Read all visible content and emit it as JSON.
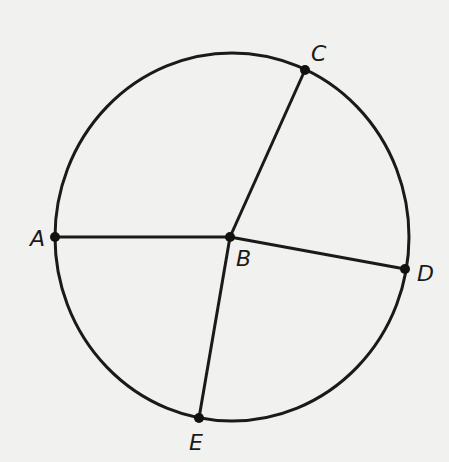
{
  "diagram": {
    "type": "circle-with-radii",
    "circle": {
      "cx": 232,
      "cy": 237,
      "rx": 177,
      "ry": 184,
      "stroke": "#1a1a1a"
    },
    "points": {
      "A": {
        "label": "A",
        "x": 55,
        "y": 237,
        "label_x": 30,
        "label_y": 246
      },
      "B": {
        "label": "B",
        "x": 230,
        "y": 237,
        "label_x": 236,
        "label_y": 266
      },
      "C": {
        "label": "C",
        "x": 305,
        "y": 70,
        "label_x": 311,
        "label_y": 61
      },
      "D": {
        "label": "D",
        "x": 405,
        "y": 269,
        "label_x": 417,
        "label_y": 281
      },
      "E": {
        "label": "E",
        "x": 199,
        "y": 418,
        "label_x": 189,
        "label_y": 450
      }
    },
    "segments": [
      {
        "from": "A",
        "to": "B"
      },
      {
        "from": "B",
        "to": "C"
      },
      {
        "from": "B",
        "to": "D"
      },
      {
        "from": "B",
        "to": "E"
      }
    ]
  }
}
